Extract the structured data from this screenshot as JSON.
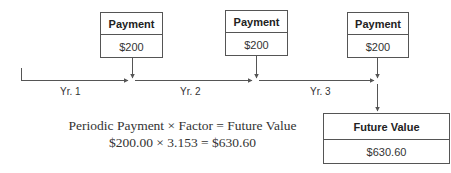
{
  "payments": [
    {
      "header": "Payment",
      "value": "$200"
    },
    {
      "header": "Payment",
      "value": "$200"
    },
    {
      "header": "Payment",
      "value": "$200"
    }
  ],
  "timeline": {
    "periods": [
      "Yr. 1",
      "Yr. 2",
      "Yr. 3"
    ]
  },
  "future_value_box": {
    "header": "Future Value",
    "value": "$630.60"
  },
  "formula": {
    "line1": "Periodic Payment × Factor = Future Value",
    "line2": "$200.00 × 3.153 = $630.60",
    "terms": {
      "periodic_payment_label": "Periodic Payment",
      "factor_label": "Factor",
      "future_value_label": "Future Value",
      "periodic_payment": "$200.00",
      "factor": "3.153",
      "future_value": "$630.60",
      "times": "×",
      "equals": "="
    }
  },
  "colors": {
    "line": "#555555",
    "text": "#333333"
  }
}
